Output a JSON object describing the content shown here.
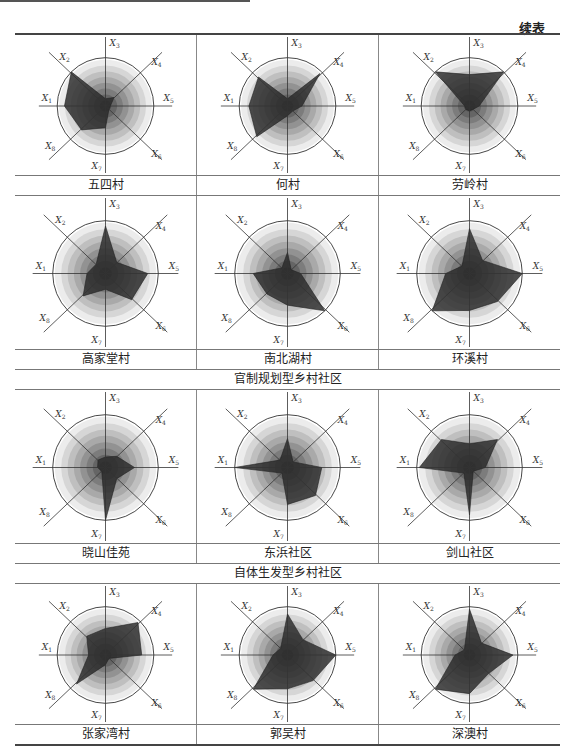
{
  "header": {
    "continued_label": "续表"
  },
  "axes": [
    "X1",
    "X2",
    "X3",
    "X4",
    "X5",
    "X6",
    "X7",
    "X8"
  ],
  "axis_angles_deg": {
    "X1": 180,
    "X2": 135,
    "X3": 90,
    "X4": 45,
    "X5": 0,
    "X6": -45,
    "X7": -90,
    "X8": -135
  },
  "colors": {
    "polygon": "#2a2a2a",
    "ring_dark": "#3c3c3c",
    "ring_light": "#ececec",
    "circle": "#333333",
    "axis": "#333333"
  },
  "groups": [
    {
      "title": "",
      "rows": [
        {
          "villages": [
            "五四村",
            "何村",
            "劳岭村"
          ]
        },
        {
          "villages": [
            "高家堂村",
            "南北湖村",
            "环溪村"
          ]
        }
      ]
    },
    {
      "title": "官制规划型乡村社区",
      "rows": [
        {
          "villages": [
            "晓山佳苑",
            "东浜社区",
            "剑山社区"
          ]
        }
      ]
    },
    {
      "title": "自体生发型乡村社区",
      "rows": [
        {
          "villages": [
            "张家湾村",
            "郭吴村",
            "深澳村"
          ]
        }
      ]
    }
  ],
  "labels": {
    "r0": [
      "五四村",
      "何村",
      "劳岭村"
    ],
    "r1": [
      "高家堂村",
      "南北湖村",
      "环溪村"
    ],
    "g1": "官制规划型乡村社区",
    "r2": [
      "晓山佳苑",
      "东浜社区",
      "剑山社区"
    ],
    "g2": "自体生发型乡村社区",
    "r3": [
      "张家湾村",
      "郭吴村",
      "深澳村"
    ]
  },
  "chart_data": [
    {
      "type": "radar",
      "title": "五四村",
      "categories": [
        "X1",
        "X2",
        "X3",
        "X4",
        "X5",
        "X6",
        "X7",
        "X8"
      ],
      "values": [
        0.85,
        1.0,
        0.15,
        0.25,
        0.1,
        0.1,
        0.45,
        0.7
      ],
      "range": [
        0,
        1
      ]
    },
    {
      "type": "radar",
      "title": "何村",
      "categories": [
        "X1",
        "X2",
        "X3",
        "X4",
        "X5",
        "X6",
        "X7",
        "X8"
      ],
      "values": [
        0.8,
        0.85,
        0.15,
        0.95,
        0.3,
        0.15,
        0.2,
        0.9
      ],
      "range": [
        0,
        1
      ]
    },
    {
      "type": "radar",
      "title": "劳岭村",
      "categories": [
        "X1",
        "X2",
        "X3",
        "X4",
        "X5",
        "X6",
        "X7",
        "X8"
      ],
      "values": [
        0.1,
        1.0,
        0.65,
        1.0,
        0.2,
        0.1,
        0.1,
        0.1
      ],
      "range": [
        0,
        1
      ]
    },
    {
      "type": "radar",
      "title": "高家堂村",
      "categories": [
        "X1",
        "X2",
        "X3",
        "X4",
        "X5",
        "X6",
        "X7",
        "X8"
      ],
      "values": [
        0.35,
        0.25,
        0.9,
        0.3,
        0.8,
        0.7,
        0.3,
        0.6
      ],
      "range": [
        0,
        1
      ]
    },
    {
      "type": "radar",
      "title": "南北湖村",
      "categories": [
        "X1",
        "X2",
        "X3",
        "X4",
        "X5",
        "X6",
        "X7",
        "X8"
      ],
      "values": [
        0.65,
        0.15,
        0.4,
        0.1,
        0.25,
        1.0,
        0.6,
        0.55
      ],
      "range": [
        0,
        1
      ]
    },
    {
      "type": "radar",
      "title": "环溪村",
      "categories": [
        "X1",
        "X2",
        "X3",
        "X4",
        "X5",
        "X6",
        "X7",
        "X8"
      ],
      "values": [
        0.45,
        0.2,
        0.85,
        0.35,
        1.0,
        0.75,
        0.7,
        1.0
      ],
      "range": [
        0,
        1
      ]
    },
    {
      "type": "radar",
      "title": "晓山佳苑",
      "categories": [
        "X1",
        "X2",
        "X3",
        "X4",
        "X5",
        "X6",
        "X7",
        "X8"
      ],
      "values": [
        0.15,
        0.2,
        0.2,
        0.3,
        0.55,
        0.3,
        1.0,
        0.1
      ],
      "range": [
        0,
        1
      ]
    },
    {
      "type": "radar",
      "title": "东浜社区",
      "categories": [
        "X1",
        "X2",
        "X3",
        "X4",
        "X5",
        "X6",
        "X7",
        "X8"
      ],
      "values": [
        1.0,
        0.2,
        0.55,
        0.15,
        0.65,
        0.75,
        0.7,
        0.15
      ],
      "range": [
        0,
        1
      ]
    },
    {
      "type": "radar",
      "title": "剑山社区",
      "categories": [
        "X1",
        "X2",
        "X3",
        "X4",
        "X5",
        "X6",
        "X7",
        "X8"
      ],
      "values": [
        0.95,
        0.75,
        0.45,
        0.75,
        0.3,
        0.1,
        0.9,
        0.15
      ],
      "range": [
        0,
        1
      ]
    },
    {
      "type": "radar",
      "title": "张家湾村",
      "categories": [
        "X1",
        "X2",
        "X3",
        "X4",
        "X5",
        "X6",
        "X7",
        "X8"
      ],
      "values": [
        0.35,
        0.55,
        0.55,
        0.95,
        0.75,
        0.1,
        0.2,
        0.85
      ],
      "range": [
        0,
        1
      ]
    },
    {
      "type": "radar",
      "title": "郭吴村",
      "categories": [
        "X1",
        "X2",
        "X3",
        "X4",
        "X5",
        "X6",
        "X7",
        "X8"
      ],
      "values": [
        0.3,
        0.2,
        0.85,
        0.45,
        1.0,
        0.75,
        0.7,
        1.0
      ],
      "range": [
        0,
        1
      ]
    },
    {
      "type": "radar",
      "title": "深澳村",
      "categories": [
        "X1",
        "X2",
        "X3",
        "X4",
        "X5",
        "X6",
        "X7",
        "X8"
      ],
      "values": [
        0.3,
        0.15,
        0.95,
        0.35,
        0.9,
        0.55,
        0.8,
        1.0
      ],
      "range": [
        0,
        1
      ]
    }
  ]
}
